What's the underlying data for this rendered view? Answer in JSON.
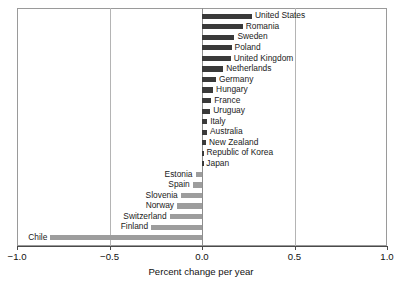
{
  "chart_data": {
    "type": "bar",
    "orientation": "horizontal",
    "title": "",
    "xlabel": "Percent change per year",
    "ylabel": "",
    "xlim": [
      -1.0,
      1.0
    ],
    "ylim": [
      0,
      21
    ],
    "grid": true,
    "legend": null,
    "xticks": [
      "−1.0",
      "−0.5",
      "0.0",
      "0.5",
      "1.0"
    ],
    "xtick_values": [
      -1.0,
      -0.5,
      0.0,
      0.5,
      1.0
    ],
    "categories": [
      "United States",
      "Romania",
      "Sweden",
      "Poland",
      "United Kingdom",
      "Netherlands",
      "Germany",
      "Hungary",
      "France",
      "Uruguay",
      "Italy",
      "Australia",
      "New Zealand",
      "Republic of Korea",
      "Japan",
      "Estonia",
      "Spain",
      "Slovenia",
      "Norway",
      "Switzerland",
      "Finland",
      "Chile"
    ],
    "values": [
      0.27,
      0.22,
      0.175,
      0.16,
      0.155,
      0.115,
      0.075,
      0.06,
      0.05,
      0.045,
      0.028,
      0.027,
      0.022,
      0.008,
      0.007,
      -0.035,
      -0.05,
      -0.115,
      -0.135,
      -0.175,
      -0.275,
      -0.82
    ],
    "colors": {
      "positive": "#3a3a3a",
      "negative": "#9d9d9d",
      "axis": "#4a4a4a",
      "grid": "#b4b4b4",
      "frame": "#9a9a9a",
      "text": "#111111"
    }
  }
}
